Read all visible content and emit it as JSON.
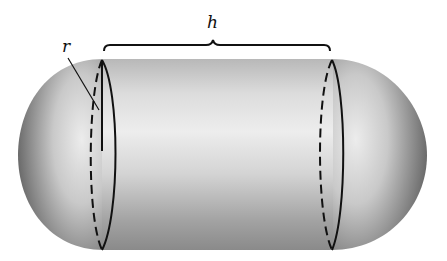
{
  "figure": {
    "labels": {
      "height": "h",
      "radius": "r"
    },
    "colors": {
      "background": "#ffffff",
      "stroke": "#111111",
      "shade_dark": "#6e6e6e",
      "shade_light": "#efefef"
    }
  }
}
